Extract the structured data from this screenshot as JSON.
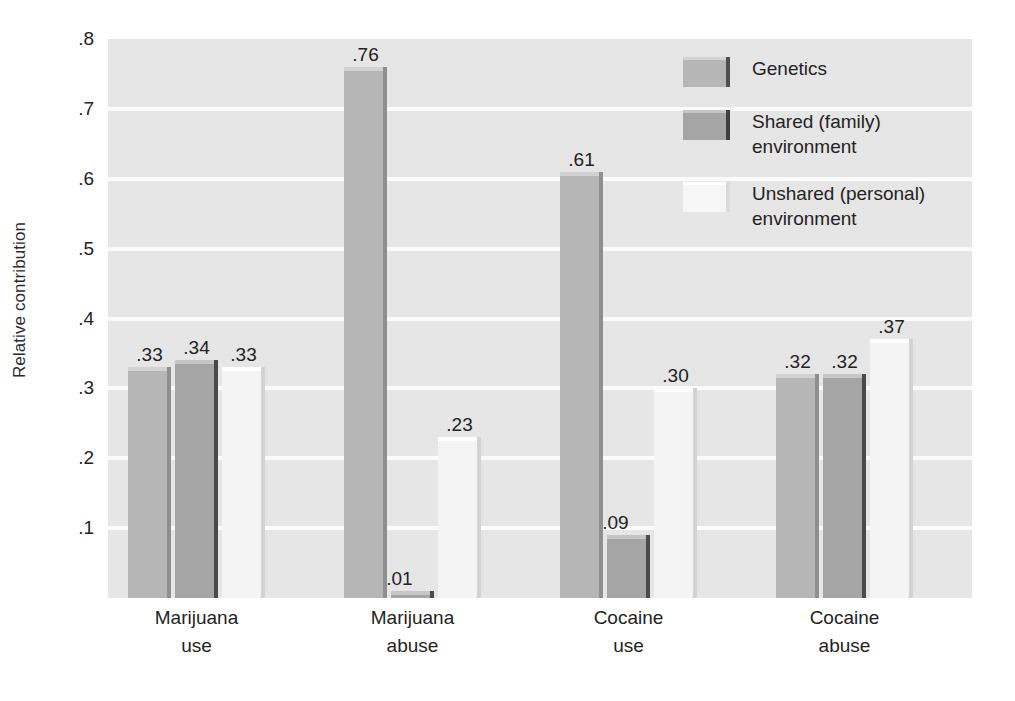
{
  "chart_data": {
    "type": "bar",
    "title": "",
    "xlabel": "",
    "ylabel": "Relative contribution",
    "ylim": [
      0,
      0.8
    ],
    "ytick_values": [
      0.8,
      0.7,
      0.6,
      0.5,
      0.4,
      0.3,
      0.2,
      0.1
    ],
    "ytick_labels": [
      ".8",
      ".7",
      ".6",
      ".5",
      ".4",
      ".3",
      ".2",
      ".1"
    ],
    "grid": "horizontal",
    "legend_position": "upper right (inside plot)",
    "categories": [
      "Marijuana\nuse",
      "Marijuana\nabuse",
      "Cocaine\nuse",
      "Cocaine\nabuse"
    ],
    "category_lines": [
      [
        "Marijuana",
        "use"
      ],
      [
        "Marijuana",
        "abuse"
      ],
      [
        "Cocaine",
        "use"
      ],
      [
        "Cocaine",
        "abuse"
      ]
    ],
    "series": [
      {
        "name": "Genetics",
        "key": "genetics",
        "color": "#b6b6b6",
        "values": [
          0.33,
          0.76,
          0.61,
          0.32
        ],
        "labels": [
          ".33",
          ".76",
          ".61",
          ".32"
        ]
      },
      {
        "name": "Shared (family)\nenvironment",
        "key": "shared",
        "color": "#a5a5a5",
        "values": [
          0.34,
          0.01,
          0.09,
          0.32
        ],
        "labels": [
          ".34",
          ".01",
          ".09",
          ".32"
        ]
      },
      {
        "name": "Unshared (personal)\nenvironment",
        "key": "unshared",
        "color": "#f4f4f4",
        "values": [
          0.33,
          0.23,
          0.3,
          0.37
        ],
        "labels": [
          ".33",
          ".23",
          ".30",
          ".37"
        ]
      }
    ]
  },
  "axes": {
    "y_title": "Relative contribution",
    "yticks": [
      {
        "label": ".8",
        "value": 0.8
      },
      {
        "label": ".7",
        "value": 0.7
      },
      {
        "label": ".6",
        "value": 0.6
      },
      {
        "label": ".5",
        "value": 0.5
      },
      {
        "label": ".4",
        "value": 0.4
      },
      {
        "label": ".3",
        "value": 0.3
      },
      {
        "label": ".2",
        "value": 0.2
      },
      {
        "label": ".1",
        "value": 0.1
      }
    ],
    "xticks": [
      {
        "line1": "Marijuana",
        "line2": "use"
      },
      {
        "line1": "Marijuana",
        "line2": "abuse"
      },
      {
        "line1": "Cocaine",
        "line2": "use"
      },
      {
        "line1": "Cocaine",
        "line2": "abuse"
      }
    ]
  },
  "legend": {
    "items": [
      {
        "key": "genetics",
        "label": "Genetics",
        "color": "#b6b6b6"
      },
      {
        "key": "shared",
        "label": "Shared (family)\nenvironment",
        "color": "#a5a5a5"
      },
      {
        "key": "unshared",
        "label": "Unshared (personal)\nenvironment",
        "color": "#f4f4f4"
      }
    ]
  },
  "colors": {
    "plot_background": "#e6e6e6",
    "gridline": "#fbfbfb",
    "page_background": "#ffffff",
    "text": "#232323"
  }
}
